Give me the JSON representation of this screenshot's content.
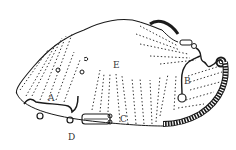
{
  "figure": {
    "labels": {
      "A": "A",
      "B": "B",
      "C": "C",
      "D": "D",
      "E": "E"
    },
    "colors": {
      "ink": "#1a1a1a",
      "label": "#333333",
      "background": "#ffffff"
    }
  }
}
